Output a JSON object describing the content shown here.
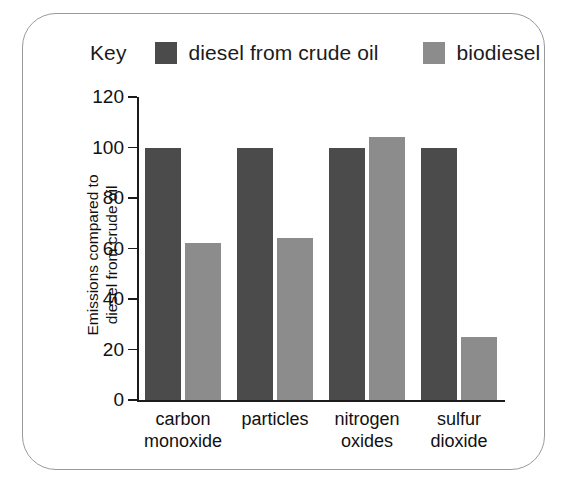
{
  "legend": {
    "key_word": "Key",
    "entries": [
      {
        "label": "diesel from crude oil",
        "color": "#4b4b4b"
      },
      {
        "label": "biodiesel",
        "color": "#8c8c8c"
      }
    ]
  },
  "axis": {
    "ylabel_line1": "Emissions compared to",
    "ylabel_line2": "diesel from crude oil"
  },
  "chart_data": {
    "type": "bar",
    "title": "",
    "xlabel": "",
    "ylabel": "Emissions compared to diesel from crude oil",
    "ylim": [
      0,
      120
    ],
    "yticks": [
      0,
      20,
      40,
      60,
      80,
      100,
      120
    ],
    "ytick_labels": [
      "0",
      "20",
      "40",
      "60",
      "80",
      "100",
      "120"
    ],
    "grid": false,
    "legend_position": "top",
    "categories": [
      "carbon monoxide",
      "particles",
      "nitrogen oxides",
      "sulfur dioxide"
    ],
    "category_lines": [
      [
        "carbon",
        "monoxide"
      ],
      [
        "particles",
        ""
      ],
      [
        "nitrogen",
        "oxides"
      ],
      [
        "sulfur",
        "dioxide"
      ]
    ],
    "series": [
      {
        "name": "diesel from crude oil",
        "color": "#4b4b4b",
        "values": [
          100,
          100,
          100,
          100
        ]
      },
      {
        "name": "biodiesel",
        "color": "#8c8c8c",
        "values": [
          62,
          64,
          104,
          25
        ]
      }
    ]
  }
}
